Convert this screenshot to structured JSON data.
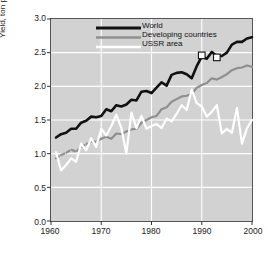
{
  "chart_data": {
    "type": "line",
    "title": "",
    "xlabel": "",
    "ylabel": "Yield, ton per hectare",
    "xlim": [
      1960,
      2000
    ],
    "ylim": [
      0.0,
      3.0
    ],
    "xticks": [
      1960,
      1970,
      1980,
      1990,
      2000
    ],
    "yticks": [
      "0.0",
      "0.5",
      "1.0",
      "1.5",
      "2.0",
      "2.5",
      "3.0"
    ],
    "grid": true,
    "grid_color": "#ffffff",
    "plot_background": "#d2d2d2",
    "legend_position": "top-left",
    "x": [
      1961,
      1962,
      1963,
      1964,
      1965,
      1966,
      1967,
      1968,
      1969,
      1970,
      1971,
      1972,
      1973,
      1974,
      1975,
      1976,
      1977,
      1978,
      1979,
      1980,
      1981,
      1982,
      1983,
      1984,
      1985,
      1986,
      1987,
      1988,
      1989,
      1990,
      1991,
      1992,
      1993,
      1994,
      1995,
      1996,
      1997,
      1998,
      1999,
      2000
    ],
    "series": [
      {
        "name": "World",
        "color": "#111111",
        "width": 2.6,
        "style": "solid",
        "values": [
          1.24,
          1.29,
          1.31,
          1.37,
          1.37,
          1.46,
          1.49,
          1.55,
          1.54,
          1.56,
          1.66,
          1.63,
          1.72,
          1.7,
          1.73,
          1.8,
          1.79,
          1.92,
          1.93,
          1.9,
          1.98,
          2.06,
          2.01,
          2.17,
          2.2,
          2.21,
          2.18,
          2.12,
          2.3,
          2.44,
          2.41,
          2.51,
          2.45,
          2.45,
          2.5,
          2.62,
          2.66,
          2.66,
          2.71,
          2.73
        ]
      },
      {
        "name": "Developing countries",
        "color": "#8f8f8f",
        "width": 2.2,
        "style": "dashed-then-solid",
        "values": [
          0.93,
          0.98,
          1.01,
          1.06,
          1.03,
          1.1,
          1.14,
          1.18,
          1.18,
          1.22,
          1.25,
          1.22,
          1.3,
          1.29,
          1.33,
          1.36,
          1.37,
          1.46,
          1.5,
          1.54,
          1.56,
          1.66,
          1.69,
          1.77,
          1.81,
          1.85,
          1.86,
          1.89,
          1.98,
          2.02,
          2.05,
          2.12,
          2.1,
          2.14,
          2.18,
          2.24,
          2.27,
          2.28,
          2.31,
          2.29
        ]
      },
      {
        "name": "USSR area",
        "color": "#ffffff",
        "width": 2.2,
        "style": "solid",
        "values": [
          1.02,
          0.75,
          0.83,
          0.93,
          0.88,
          1.15,
          1.05,
          1.23,
          1.1,
          1.37,
          1.27,
          1.41,
          1.58,
          1.38,
          1.0,
          1.61,
          1.38,
          1.56,
          1.37,
          1.41,
          1.44,
          1.38,
          1.52,
          1.48,
          1.59,
          1.72,
          1.65,
          1.95,
          1.75,
          1.7,
          1.55,
          1.62,
          1.72,
          1.3,
          1.37,
          1.31,
          1.68,
          1.15,
          1.38,
          1.5
        ]
      }
    ],
    "markers": [
      {
        "series": "World",
        "x": 1990,
        "y": 2.46,
        "shape": "open-square"
      },
      {
        "series": "World",
        "x": 1993,
        "y": 2.43,
        "shape": "open-square"
      }
    ]
  },
  "legend": {
    "items": [
      {
        "label": "World"
      },
      {
        "label": "Developing countries"
      },
      {
        "label": "USSR area"
      }
    ]
  }
}
